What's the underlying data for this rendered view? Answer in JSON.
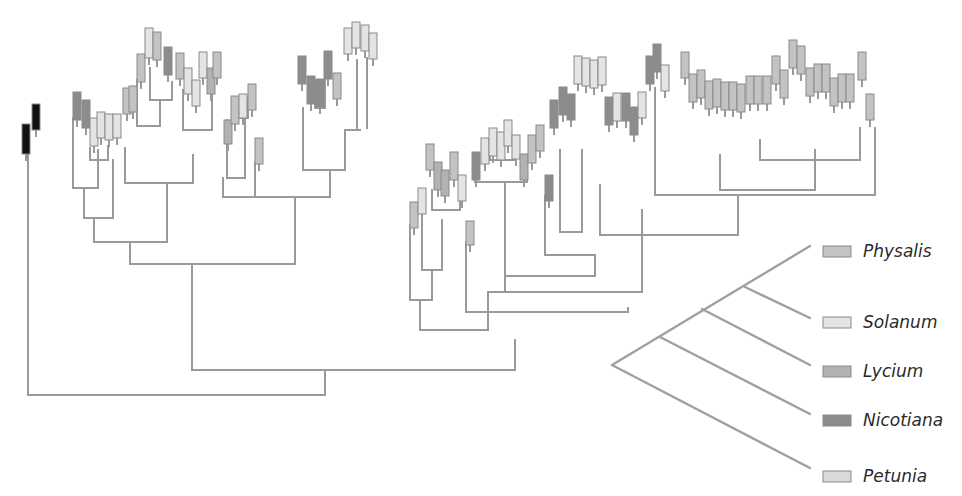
{
  "colors": {
    "Physalis": "#c3c3c3",
    "Solanum": "#e4e4e4",
    "Lycium": "#b2b2b2",
    "Nicotiana": "#8c8c8c",
    "Petunia": "#d9d9d9",
    "Outgroup": "#111111",
    "edge": "#9a9a9a"
  },
  "legend": {
    "items": [
      {
        "genus": "Physalis",
        "label": "Physalis",
        "y": 251
      },
      {
        "genus": "Solanum",
        "label": "Solanum",
        "y": 322
      },
      {
        "genus": "Lycium",
        "label": "Lycium",
        "y": 371
      },
      {
        "genus": "Nicotiana",
        "label": "Nicotiana",
        "y": 420
      },
      {
        "genus": "Petunia",
        "label": "Petunia",
        "y": 476
      }
    ],
    "cladogram": {
      "root": [
        612,
        365
      ],
      "tips": [
        [
          810,
          246
        ],
        [
          810,
          318
        ],
        [
          810,
          365
        ],
        [
          810,
          414
        ],
        [
          810,
          468
        ]
      ],
      "nodes": [
        [
          745,
          287
        ],
        [
          702,
          309
        ],
        [
          660,
          337
        ]
      ]
    }
  },
  "tree": {
    "edges": [
      [
        28,
        395,
        325,
        395
      ],
      [
        28,
        155,
        28,
        395
      ],
      [
        325,
        370,
        325,
        395
      ],
      [
        192,
        370,
        515,
        370
      ],
      [
        192,
        264,
        192,
        370
      ],
      [
        515,
        340,
        515,
        370
      ],
      [
        130,
        264,
        295,
        264
      ],
      [
        130,
        242,
        130,
        264
      ],
      [
        295,
        197,
        295,
        264
      ],
      [
        94,
        242,
        167,
        242
      ],
      [
        94,
        218,
        94,
        242
      ],
      [
        167,
        183,
        167,
        242
      ],
      [
        84,
        218,
        113,
        218
      ],
      [
        84,
        188,
        84,
        218
      ],
      [
        113,
        160,
        113,
        218
      ],
      [
        73,
        188,
        98,
        188
      ],
      [
        73,
        118,
        73,
        188
      ],
      [
        98,
        150,
        98,
        188
      ],
      [
        90,
        160,
        108,
        160
      ],
      [
        90,
        148,
        90,
        160
      ],
      [
        108,
        146,
        108,
        160
      ],
      [
        125,
        183,
        193,
        183
      ],
      [
        125,
        148,
        125,
        183
      ],
      [
        193,
        155,
        193,
        183
      ],
      [
        137,
        126,
        160,
        126
      ],
      [
        137,
        80,
        137,
        126
      ],
      [
        160,
        100,
        160,
        126
      ],
      [
        150,
        100,
        172,
        100
      ],
      [
        150,
        68,
        150,
        100
      ],
      [
        172,
        82,
        172,
        100
      ],
      [
        183,
        130,
        212,
        130
      ],
      [
        183,
        90,
        183,
        130
      ],
      [
        212,
        88,
        212,
        130
      ],
      [
        223,
        197,
        330,
        197
      ],
      [
        223,
        178,
        223,
        197
      ],
      [
        330,
        170,
        330,
        197
      ],
      [
        227,
        178,
        245,
        178
      ],
      [
        227,
        120,
        227,
        178
      ],
      [
        245,
        118,
        245,
        178
      ],
      [
        233,
        118,
        248,
        118
      ],
      [
        233,
        112,
        233,
        118
      ],
      [
        248,
        98,
        248,
        118
      ],
      [
        255,
        197,
        295,
        197
      ],
      [
        255,
        162,
        255,
        197
      ],
      [
        303,
        170,
        345,
        170
      ],
      [
        303,
        108,
        303,
        170
      ],
      [
        345,
        130,
        345,
        170
      ],
      [
        315,
        108,
        325,
        108
      ],
      [
        315,
        82,
        315,
        108
      ],
      [
        325,
        80,
        325,
        108
      ],
      [
        345,
        130,
        360,
        130
      ],
      [
        357,
        60,
        357,
        130
      ],
      [
        367,
        58,
        367,
        128
      ],
      [
        420,
        330,
        488,
        330
      ],
      [
        420,
        300,
        420,
        330
      ],
      [
        488,
        292,
        488,
        330
      ],
      [
        410,
        300,
        432,
        300
      ],
      [
        410,
        225,
        410,
        300
      ],
      [
        432,
        270,
        432,
        300
      ],
      [
        422,
        270,
        442,
        270
      ],
      [
        422,
        200,
        422,
        270
      ],
      [
        442,
        220,
        442,
        270
      ],
      [
        432,
        210,
        460,
        210
      ],
      [
        432,
        190,
        432,
        210
      ],
      [
        460,
        200,
        460,
        210
      ],
      [
        466,
        312,
        628,
        312
      ],
      [
        466,
        242,
        466,
        312
      ],
      [
        628,
        308,
        628,
        312
      ],
      [
        488,
        292,
        642,
        292
      ],
      [
        505,
        276,
        505,
        292
      ],
      [
        642,
        210,
        642,
        292
      ],
      [
        505,
        276,
        595,
        276
      ],
      [
        505,
        182,
        505,
        276
      ],
      [
        595,
        255,
        595,
        276
      ],
      [
        475,
        182,
        527,
        182
      ],
      [
        475,
        175,
        475,
        182
      ],
      [
        527,
        170,
        527,
        182
      ],
      [
        490,
        160,
        515,
        160
      ],
      [
        490,
        155,
        490,
        160
      ],
      [
        515,
        150,
        515,
        160
      ],
      [
        545,
        255,
        595,
        255
      ],
      [
        545,
        196,
        545,
        255
      ],
      [
        560,
        232,
        582,
        232
      ],
      [
        560,
        150,
        560,
        232
      ],
      [
        582,
        150,
        582,
        232
      ],
      [
        600,
        235,
        738,
        235
      ],
      [
        600,
        185,
        600,
        235
      ],
      [
        738,
        195,
        738,
        235
      ],
      [
        655,
        195,
        875,
        195
      ],
      [
        655,
        88,
        655,
        195
      ],
      [
        875,
        128,
        875,
        195
      ],
      [
        720,
        190,
        815,
        190
      ],
      [
        720,
        155,
        720,
        190
      ],
      [
        815,
        150,
        815,
        190
      ],
      [
        760,
        160,
        860,
        160
      ],
      [
        760,
        140,
        760,
        160
      ],
      [
        860,
        128,
        860,
        160
      ]
    ],
    "tips": [
      {
        "x": 22,
        "y": 124,
        "h": 30,
        "genus": "Outgroup"
      },
      {
        "x": 32,
        "y": 104,
        "h": 26,
        "genus": "Outgroup"
      },
      {
        "x": 73,
        "y": 92,
        "h": 28,
        "genus": "Nicotiana"
      },
      {
        "x": 82,
        "y": 100,
        "h": 28,
        "genus": "Nicotiana"
      },
      {
        "x": 90,
        "y": 118,
        "h": 28,
        "genus": "Solanum"
      },
      {
        "x": 97,
        "y": 112,
        "h": 26,
        "genus": "Solanum"
      },
      {
        "x": 105,
        "y": 114,
        "h": 26,
        "genus": "Solanum"
      },
      {
        "x": 113,
        "y": 114,
        "h": 24,
        "genus": "Solanum"
      },
      {
        "x": 123,
        "y": 88,
        "h": 26,
        "genus": "Physalis"
      },
      {
        "x": 129,
        "y": 86,
        "h": 26,
        "genus": "Physalis"
      },
      {
        "x": 137,
        "y": 54,
        "h": 28,
        "genus": "Physalis"
      },
      {
        "x": 145,
        "y": 28,
        "h": 30,
        "genus": "Solanum"
      },
      {
        "x": 153,
        "y": 32,
        "h": 28,
        "genus": "Physalis"
      },
      {
        "x": 164,
        "y": 47,
        "h": 28,
        "genus": "Nicotiana"
      },
      {
        "x": 176,
        "y": 53,
        "h": 26,
        "genus": "Physalis"
      },
      {
        "x": 184,
        "y": 68,
        "h": 26,
        "genus": "Solanum"
      },
      {
        "x": 192,
        "y": 80,
        "h": 26,
        "genus": "Solanum"
      },
      {
        "x": 199,
        "y": 52,
        "h": 26,
        "genus": "Solanum"
      },
      {
        "x": 207,
        "y": 68,
        "h": 26,
        "genus": "Lycium"
      },
      {
        "x": 213,
        "y": 52,
        "h": 26,
        "genus": "Physalis"
      },
      {
        "x": 224,
        "y": 120,
        "h": 24,
        "genus": "Lycium"
      },
      {
        "x": 231,
        "y": 96,
        "h": 28,
        "genus": "Physalis"
      },
      {
        "x": 239,
        "y": 94,
        "h": 24,
        "genus": "Solanum"
      },
      {
        "x": 248,
        "y": 84,
        "h": 26,
        "genus": "Physalis"
      },
      {
        "x": 255,
        "y": 138,
        "h": 26,
        "genus": "Physalis"
      },
      {
        "x": 298,
        "y": 56,
        "h": 28,
        "genus": "Nicotiana"
      },
      {
        "x": 307,
        "y": 76,
        "h": 28,
        "genus": "Nicotiana"
      },
      {
        "x": 316,
        "y": 79,
        "h": 28,
        "genus": "Nicotiana"
      },
      {
        "x": 324,
        "y": 51,
        "h": 28,
        "genus": "Nicotiana"
      },
      {
        "x": 333,
        "y": 73,
        "h": 26,
        "genus": "Physalis"
      },
      {
        "x": 344,
        "y": 28,
        "h": 26,
        "genus": "Solanum"
      },
      {
        "x": 352,
        "y": 22,
        "h": 26,
        "genus": "Solanum"
      },
      {
        "x": 361,
        "y": 25,
        "h": 26,
        "genus": "Solanum"
      },
      {
        "x": 369,
        "y": 33,
        "h": 26,
        "genus": "Solanum"
      },
      {
        "x": 410,
        "y": 202,
        "h": 26,
        "genus": "Physalis"
      },
      {
        "x": 418,
        "y": 188,
        "h": 26,
        "genus": "Solanum"
      },
      {
        "x": 426,
        "y": 144,
        "h": 26,
        "genus": "Physalis"
      },
      {
        "x": 434,
        "y": 162,
        "h": 28,
        "genus": "Lycium"
      },
      {
        "x": 441,
        "y": 170,
        "h": 26,
        "genus": "Lycium"
      },
      {
        "x": 450,
        "y": 152,
        "h": 28,
        "genus": "Physalis"
      },
      {
        "x": 458,
        "y": 175,
        "h": 26,
        "genus": "Solanum"
      },
      {
        "x": 466,
        "y": 221,
        "h": 24,
        "genus": "Physalis"
      },
      {
        "x": 472,
        "y": 152,
        "h": 28,
        "genus": "Nicotiana"
      },
      {
        "x": 481,
        "y": 138,
        "h": 26,
        "genus": "Solanum"
      },
      {
        "x": 489,
        "y": 128,
        "h": 28,
        "genus": "Solanum"
      },
      {
        "x": 497,
        "y": 132,
        "h": 28,
        "genus": "Solanum"
      },
      {
        "x": 504,
        "y": 120,
        "h": 26,
        "genus": "Solanum"
      },
      {
        "x": 512,
        "y": 135,
        "h": 24,
        "genus": "Solanum"
      },
      {
        "x": 520,
        "y": 154,
        "h": 26,
        "genus": "Lycium"
      },
      {
        "x": 528,
        "y": 135,
        "h": 28,
        "genus": "Physalis"
      },
      {
        "x": 536,
        "y": 125,
        "h": 26,
        "genus": "Physalis"
      },
      {
        "x": 545,
        "y": 175,
        "h": 26,
        "genus": "Nicotiana"
      },
      {
        "x": 550,
        "y": 100,
        "h": 28,
        "genus": "Nicotiana"
      },
      {
        "x": 559,
        "y": 87,
        "h": 28,
        "genus": "Nicotiana"
      },
      {
        "x": 567,
        "y": 94,
        "h": 26,
        "genus": "Nicotiana"
      },
      {
        "x": 574,
        "y": 56,
        "h": 28,
        "genus": "Solanum"
      },
      {
        "x": 582,
        "y": 58,
        "h": 28,
        "genus": "Solanum"
      },
      {
        "x": 590,
        "y": 60,
        "h": 28,
        "genus": "Solanum"
      },
      {
        "x": 598,
        "y": 57,
        "h": 28,
        "genus": "Solanum"
      },
      {
        "x": 605,
        "y": 97,
        "h": 28,
        "genus": "Nicotiana"
      },
      {
        "x": 613,
        "y": 93,
        "h": 28,
        "genus": "Solanum"
      },
      {
        "x": 622,
        "y": 93,
        "h": 28,
        "genus": "Nicotiana"
      },
      {
        "x": 630,
        "y": 107,
        "h": 28,
        "genus": "Nicotiana"
      },
      {
        "x": 638,
        "y": 92,
        "h": 26,
        "genus": "Solanum"
      },
      {
        "x": 646,
        "y": 56,
        "h": 28,
        "genus": "Nicotiana"
      },
      {
        "x": 653,
        "y": 44,
        "h": 28,
        "genus": "Nicotiana"
      },
      {
        "x": 661,
        "y": 65,
        "h": 26,
        "genus": "Solanum"
      },
      {
        "x": 681,
        "y": 52,
        "h": 26,
        "genus": "Physalis"
      },
      {
        "x": 689,
        "y": 74,
        "h": 28,
        "genus": "Physalis"
      },
      {
        "x": 697,
        "y": 70,
        "h": 28,
        "genus": "Physalis"
      },
      {
        "x": 705,
        "y": 81,
        "h": 28,
        "genus": "Physalis"
      },
      {
        "x": 713,
        "y": 79,
        "h": 28,
        "genus": "Physalis"
      },
      {
        "x": 721,
        "y": 82,
        "h": 28,
        "genus": "Physalis"
      },
      {
        "x": 729,
        "y": 82,
        "h": 28,
        "genus": "Physalis"
      },
      {
        "x": 737,
        "y": 84,
        "h": 28,
        "genus": "Physalis"
      },
      {
        "x": 746,
        "y": 76,
        "h": 28,
        "genus": "Physalis"
      },
      {
        "x": 754,
        "y": 76,
        "h": 28,
        "genus": "Physalis"
      },
      {
        "x": 763,
        "y": 76,
        "h": 28,
        "genus": "Physalis"
      },
      {
        "x": 772,
        "y": 56,
        "h": 28,
        "genus": "Physalis"
      },
      {
        "x": 780,
        "y": 70,
        "h": 28,
        "genus": "Physalis"
      },
      {
        "x": 789,
        "y": 40,
        "h": 28,
        "genus": "Physalis"
      },
      {
        "x": 797,
        "y": 46,
        "h": 28,
        "genus": "Physalis"
      },
      {
        "x": 806,
        "y": 68,
        "h": 28,
        "genus": "Physalis"
      },
      {
        "x": 814,
        "y": 64,
        "h": 28,
        "genus": "Physalis"
      },
      {
        "x": 822,
        "y": 64,
        "h": 28,
        "genus": "Physalis"
      },
      {
        "x": 830,
        "y": 78,
        "h": 28,
        "genus": "Physalis"
      },
      {
        "x": 838,
        "y": 74,
        "h": 28,
        "genus": "Physalis"
      },
      {
        "x": 846,
        "y": 74,
        "h": 28,
        "genus": "Physalis"
      },
      {
        "x": 858,
        "y": 52,
        "h": 28,
        "genus": "Physalis"
      },
      {
        "x": 866,
        "y": 94,
        "h": 26,
        "genus": "Physalis"
      }
    ]
  }
}
